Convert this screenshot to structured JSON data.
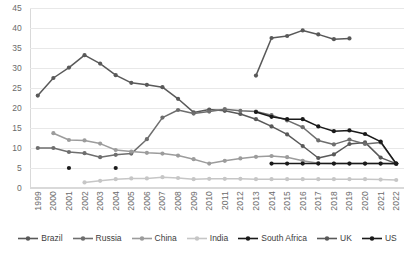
{
  "chart_data": {
    "type": "line",
    "title": "",
    "xlabel": "",
    "ylabel": "",
    "ylim": [
      0,
      45
    ],
    "ytick_step": 5,
    "yticks": [
      0,
      5,
      10,
      15,
      20,
      25,
      30,
      35,
      40,
      45
    ],
    "grid": true,
    "legend_position": "bottom",
    "categories": [
      "1999",
      "2000",
      "2001",
      "2002",
      "2003",
      "2004",
      "2005",
      "2006",
      "2007",
      "2008",
      "2009",
      "2010",
      "2011",
      "2012",
      "2013",
      "2014",
      "2015",
      "2016",
      "2017",
      "2018",
      "2019",
      "2020",
      "2021",
      "2022"
    ],
    "series": [
      {
        "name": "Brazil",
        "color": "#595959",
        "values": [
          23.1,
          27.5,
          30.1,
          33.2,
          31.1,
          28.2,
          26.3,
          25.8,
          25.2,
          22.3,
          18.9,
          19.6,
          19.3,
          18.5,
          17.2,
          15.4,
          13.4,
          10.5,
          7.5,
          8.4,
          11.0,
          11.4,
          7.6,
          6.1
        ]
      },
      {
        "name": "Russia",
        "color": "#6e6e6e",
        "values": [
          10.0,
          10.0,
          9.0,
          8.7,
          7.7,
          8.3,
          8.6,
          12.2,
          17.6,
          19.5,
          18.6,
          19.1,
          19.7,
          19.3,
          19.1,
          18.2,
          16.9,
          15.2,
          11.9,
          10.9,
          12.1,
          11.0,
          11.4,
          6.0
        ]
      },
      {
        "name": "China",
        "color": "#9c9c9c",
        "values": [
          null,
          13.7,
          12.0,
          11.9,
          11.1,
          9.5,
          9.1,
          8.8,
          8.6,
          8.1,
          7.2,
          6.1,
          6.8,
          7.4,
          7.8,
          8.0,
          7.7,
          6.8,
          6.2,
          6.1,
          6.1,
          6.1,
          6.1,
          6.0
        ]
      },
      {
        "name": "India",
        "color": "#c6c6c6",
        "values": [
          null,
          null,
          null,
          1.4,
          1.8,
          2.2,
          2.4,
          2.4,
          2.7,
          2.5,
          2.2,
          2.3,
          2.3,
          2.3,
          2.2,
          2.2,
          2.2,
          2.2,
          2.2,
          2.2,
          2.2,
          2.2,
          2.1,
          2.0
        ]
      },
      {
        "name": "South Africa",
        "color": "#1a1a1a",
        "values": [
          null,
          null,
          5.0,
          null,
          null,
          5.0,
          null,
          null,
          null,
          null,
          null,
          null,
          null,
          null,
          null,
          6.1,
          6.1,
          6.1,
          6.1,
          6.1,
          6.1,
          6.1,
          6.1,
          6.1
        ]
      },
      {
        "name": "UK",
        "color": "#595959",
        "values": [
          null,
          null,
          null,
          null,
          null,
          null,
          null,
          null,
          null,
          null,
          null,
          null,
          null,
          null,
          28.1,
          37.5,
          38.0,
          39.4,
          38.4,
          37.2,
          37.4,
          null,
          null,
          null
        ]
      },
      {
        "name": "US",
        "color": "#1a1a1a",
        "values": [
          null,
          null,
          null,
          null,
          null,
          null,
          null,
          null,
          null,
          null,
          null,
          null,
          null,
          null,
          19.0,
          17.8,
          17.2,
          17.2,
          15.4,
          14.2,
          14.4,
          13.5,
          11.6,
          6.1
        ]
      }
    ]
  },
  "legend": {
    "items": [
      {
        "label": "Brazil"
      },
      {
        "label": "Russia"
      },
      {
        "label": "China"
      },
      {
        "label": "India"
      },
      {
        "label": "South Africa"
      },
      {
        "label": "UK"
      },
      {
        "label": "US"
      }
    ]
  }
}
